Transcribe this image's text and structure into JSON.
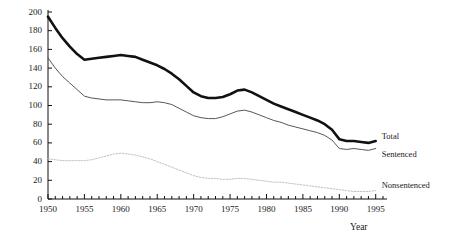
{
  "chart_data": {
    "type": "line",
    "title": "",
    "xlabel": "Year",
    "ylabel": "Incarceration rate per 100,000 inhabitants",
    "xlim": [
      1950,
      1996
    ],
    "ylim": [
      0,
      200
    ],
    "xticks": [
      1950,
      1955,
      1960,
      1965,
      1970,
      1975,
      1980,
      1985,
      1990,
      1995
    ],
    "yticks": [
      0,
      20,
      40,
      60,
      80,
      100,
      120,
      140,
      160,
      180,
      200
    ],
    "grid": false,
    "legend_position": "right-inline",
    "x": [
      1950,
      1951,
      1952,
      1953,
      1954,
      1955,
      1956,
      1957,
      1958,
      1959,
      1960,
      1961,
      1962,
      1963,
      1964,
      1965,
      1966,
      1967,
      1968,
      1969,
      1970,
      1971,
      1972,
      1973,
      1974,
      1975,
      1976,
      1977,
      1978,
      1979,
      1980,
      1981,
      1982,
      1983,
      1984,
      1985,
      1986,
      1987,
      1988,
      1989,
      1990,
      1991,
      1992,
      1993,
      1994,
      1995
    ],
    "series": [
      {
        "name": "Total",
        "style": "thick-solid",
        "color": "#111111",
        "values": [
          195,
          183,
          172,
          163,
          155,
          149,
          150,
          151,
          152,
          153,
          154,
          153,
          152,
          149,
          146,
          143,
          139,
          134,
          128,
          121,
          114,
          110,
          108,
          108,
          109,
          112,
          116,
          117,
          114,
          110,
          106,
          102,
          99,
          96,
          93,
          90,
          87,
          84,
          80,
          74,
          64,
          62,
          62,
          61,
          60,
          62
        ]
      },
      {
        "name": "Sentenced",
        "style": "thin-solid",
        "color": "#444444",
        "values": [
          151,
          140,
          131,
          124,
          117,
          110,
          108,
          107,
          106,
          106,
          106,
          105,
          104,
          103,
          103,
          104,
          103,
          101,
          97,
          93,
          89,
          87,
          86,
          86,
          88,
          91,
          94,
          95,
          93,
          90,
          87,
          84,
          82,
          79,
          77,
          75,
          73,
          71,
          68,
          63,
          54,
          53,
          54,
          53,
          52,
          54
        ]
      },
      {
        "name": "Nonsentenced",
        "style": "dotted",
        "color": "#b9b9b9",
        "values": [
          43,
          42,
          41,
          41,
          41,
          41,
          42,
          44,
          46,
          48,
          49,
          48,
          47,
          45,
          43,
          40,
          37,
          34,
          31,
          28,
          25,
          23,
          22,
          22,
          21,
          21,
          22,
          22,
          21,
          20,
          19,
          18,
          18,
          17,
          16,
          15,
          14,
          13,
          12,
          11,
          10,
          9,
          8,
          8,
          8,
          9
        ]
      }
    ]
  },
  "axis": {
    "y_title": "Incarceration rate per 100,000 inhabitants",
    "x_title": "Year"
  },
  "series_labels": {
    "total": "Total",
    "sentenced": "Sentenced",
    "nonsentenced": "Nonsentenced"
  }
}
